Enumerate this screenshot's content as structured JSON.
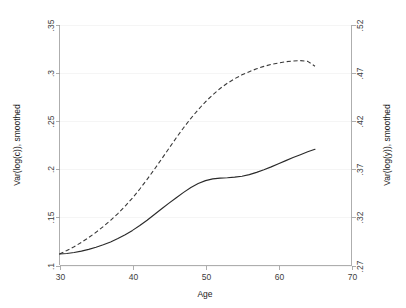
{
  "chart_data": {
    "type": "line",
    "title": "",
    "subtitle": "",
    "xlabel": "Age",
    "ylabel": "Var(log(c)), smoothed",
    "y2label": "Var(log(y)), smoothed",
    "xlim": [
      30,
      70
    ],
    "ylim": [
      0.1,
      0.35
    ],
    "y2lim": [
      0.27,
      0.52
    ],
    "xticks": [
      "30",
      "40",
      "50",
      "60",
      "70"
    ],
    "xtick_values": [
      30,
      40,
      50,
      60,
      70
    ],
    "yticks": [
      ".1",
      ".15",
      ".2",
      ".25",
      ".3",
      ".35"
    ],
    "ytick_values": [
      0.1,
      0.15,
      0.2,
      0.25,
      0.3,
      0.35
    ],
    "y2ticks": [
      ".27",
      ".32",
      ".37",
      ".42",
      ".47",
      ".52"
    ],
    "y2tick_values": [
      0.27,
      0.32,
      0.37,
      0.42,
      0.47,
      0.52
    ],
    "grid": true,
    "grid_axis": "y",
    "legend": false,
    "legend_position": "none",
    "annotations": [],
    "series": [
      {
        "name": "Var(log(c)), smoothed",
        "axis": "left",
        "style": "solid",
        "color": "#2a2a2a",
        "x": [
          30,
          31,
          32,
          33,
          34,
          35,
          36,
          37,
          38,
          39,
          40,
          41,
          42,
          43,
          44,
          45,
          46,
          47,
          48,
          49,
          50,
          51,
          52,
          53,
          54,
          55,
          56,
          57,
          58,
          59,
          60,
          61,
          62,
          63,
          64,
          65
        ],
        "values": [
          0.112,
          0.1125,
          0.1135,
          0.115,
          0.1168,
          0.119,
          0.1215,
          0.1245,
          0.128,
          0.132,
          0.1365,
          0.1415,
          0.147,
          0.153,
          0.159,
          0.1648,
          0.1705,
          0.176,
          0.181,
          0.1852,
          0.1882,
          0.19,
          0.1908,
          0.1912,
          0.1918,
          0.1928,
          0.1945,
          0.1968,
          0.1995,
          0.2025,
          0.2058,
          0.209,
          0.2122,
          0.2152,
          0.2182,
          0.2208
        ]
      },
      {
        "name": "Var(log(y)), smoothed",
        "axis": "right",
        "style": "dashed",
        "color": "#3a3a3a",
        "x": [
          30,
          31,
          32,
          33,
          34,
          35,
          36,
          37,
          38,
          39,
          40,
          41,
          42,
          43,
          44,
          45,
          46,
          47,
          48,
          49,
          50,
          51,
          52,
          53,
          54,
          55,
          56,
          57,
          58,
          59,
          60,
          61,
          62,
          63,
          64,
          65
        ],
        "values_left_scale": [
          0.112,
          0.1155,
          0.1195,
          0.124,
          0.129,
          0.1345,
          0.1405,
          0.147,
          0.154,
          0.1618,
          0.1702,
          0.1795,
          0.1895,
          0.2,
          0.2108,
          0.2218,
          0.2328,
          0.2432,
          0.253,
          0.262,
          0.2702,
          0.2775,
          0.284,
          0.2895,
          0.2942,
          0.2982,
          0.3015,
          0.3045,
          0.307,
          0.309,
          0.3105,
          0.3118,
          0.3126,
          0.313,
          0.3122,
          0.3072
        ],
        "values": [
          0.382,
          0.3855,
          0.3895,
          0.394,
          0.399,
          0.4045,
          0.4105,
          0.417,
          0.424,
          0.4318,
          0.4402,
          0.4495,
          0.4595,
          0.47,
          0.4808,
          0.4918,
          0.5028,
          0.5132,
          0.523,
          0.532,
          0.5402,
          0.5475,
          0.554,
          0.5595,
          0.5642,
          0.5682,
          0.5715,
          0.5745,
          0.577,
          0.579,
          0.5805,
          0.5818,
          0.5826,
          0.583,
          0.5822,
          0.5772
        ]
      }
    ],
    "notes": {
      "left_series_label": "Var(log(c)), smoothed",
      "right_series_label": "Var(log(y)), smoothed",
      "solid_start_value": "0.112",
      "solid_end_value": "0.221",
      "dashed_peak_left_scale": "0.313",
      "dashed_peak_age": "63",
      "dashed_end_left_scale": "0.307",
      "age_range_observed": "30 to 65"
    }
  }
}
